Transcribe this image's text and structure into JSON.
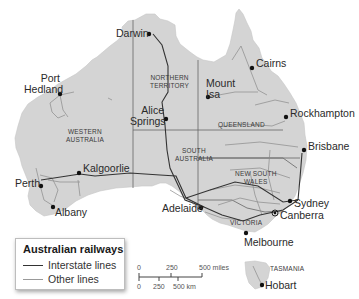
{
  "map": {
    "title": "Australian railways",
    "colors": {
      "land": "#d4d4d4",
      "border": "#555555",
      "interstate_line": "#333333",
      "other_line": "#8a8a8a",
      "city_marker": "#111111",
      "background": "#ffffff"
    },
    "states": [
      {
        "id": "wa",
        "label_line1": "WESTERN",
        "label_line2": "AUSTRALIA"
      },
      {
        "id": "nt",
        "label_line1": "NORTHERN",
        "label_line2": "TERRITORY"
      },
      {
        "id": "qld",
        "label_line1": "QUEENSLAND",
        "label_line2": ""
      },
      {
        "id": "sa",
        "label_line1": "SOUTH",
        "label_line2": "AUSTRALIA"
      },
      {
        "id": "nsw",
        "label_line1": "NEW SOUTH",
        "label_line2": "WALES"
      },
      {
        "id": "vic",
        "label_line1": "VICTORIA",
        "label_line2": ""
      },
      {
        "id": "tas",
        "label_line1": "TASMANIA",
        "label_line2": ""
      }
    ],
    "cities": [
      {
        "id": "darwin",
        "name": "Darwin"
      },
      {
        "id": "cairns",
        "name": "Cairns"
      },
      {
        "id": "port-hedland",
        "name_line1": "Port",
        "name_line2": "Hedland"
      },
      {
        "id": "mount-isa",
        "name_line1": "Mount",
        "name_line2": "Isa"
      },
      {
        "id": "alice-springs",
        "name_line1": "Alice",
        "name_line2": "Springs"
      },
      {
        "id": "rockhampton",
        "name": "Rockhampton"
      },
      {
        "id": "brisbane",
        "name": "Brisbane"
      },
      {
        "id": "kalgoorlie",
        "name": "Kalgoorlie"
      },
      {
        "id": "perth",
        "name": "Perth"
      },
      {
        "id": "albany",
        "name": "Albany"
      },
      {
        "id": "adelaide",
        "name": "Adelaide"
      },
      {
        "id": "sydney",
        "name": "Sydney"
      },
      {
        "id": "canberra",
        "name": "Canberra"
      },
      {
        "id": "melbourne",
        "name": "Melbourne"
      },
      {
        "id": "hobart",
        "name": "Hobart"
      }
    ]
  },
  "legend": {
    "title": "Australian railways",
    "items": [
      {
        "label": "Interstate lines",
        "style": "interstate"
      },
      {
        "label": "Other lines",
        "style": "other"
      }
    ]
  },
  "scale_bar": {
    "miles_ticks": [
      "0",
      "250",
      "500 miles"
    ],
    "km_ticks": [
      "0",
      "250",
      "500 km"
    ]
  }
}
